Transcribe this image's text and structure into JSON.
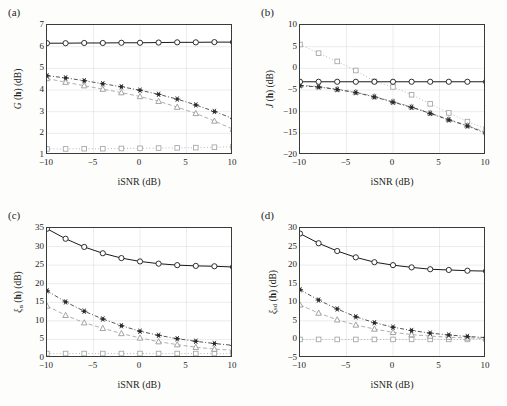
{
  "figure": {
    "background": "#fdfdfb",
    "axis_color": "#3a3a3a",
    "grid_color": "#d8d8d8"
  },
  "series_styles": [
    {
      "name": "circle-solid",
      "marker": "circle",
      "line": "solid",
      "color": "#1a1a1a",
      "fill": "none"
    },
    {
      "name": "star-dashdot",
      "marker": "star",
      "line": "dashdot",
      "color": "#2b2b2b",
      "fill": "#2b2b2b"
    },
    {
      "name": "triangle-dashed",
      "marker": "triangle",
      "line": "dashed",
      "color": "#9a9a9a",
      "fill": "none"
    },
    {
      "name": "square-dotted",
      "marker": "square",
      "line": "dotted",
      "color": "#a8a8a8",
      "fill": "none"
    }
  ],
  "panels": [
    {
      "label": "(a)",
      "name": "panel-a",
      "chart_data": {
        "type": "line",
        "title": "",
        "xlabel": "iSNR (dB)",
        "ylabel": "G(h) (dB)",
        "ylabel_main": "G",
        "ylabel_sub": "",
        "ylabel_tail": "(h) (dB)",
        "xlim": [
          -10,
          10
        ],
        "ylim": [
          1,
          7
        ],
        "xticks": [
          -10,
          -5,
          0,
          5,
          10
        ],
        "xticklabels": [
          "-10",
          "-5",
          "0",
          "5",
          "10"
        ],
        "yticks": [
          1,
          2,
          3,
          4,
          5,
          6,
          7
        ],
        "yticklabels": [
          "1",
          "2",
          "3",
          "4",
          "5",
          "6",
          "7"
        ],
        "grid": true,
        "legend": "none",
        "x": [
          -10,
          -8,
          -6,
          -4,
          -2,
          0,
          2,
          4,
          6,
          8,
          10
        ],
        "series": [
          {
            "name": "circle-solid",
            "values": [
              6.16,
              6.16,
              6.17,
              6.17,
              6.18,
              6.18,
              6.19,
              6.2,
              6.2,
              6.21,
              6.21
            ]
          },
          {
            "name": "star-dashdot",
            "values": [
              4.66,
              4.56,
              4.43,
              4.29,
              4.15,
              3.99,
              3.8,
              3.58,
              3.31,
              3.01,
              2.68
            ]
          },
          {
            "name": "triangle-dashed",
            "values": [
              4.53,
              4.36,
              4.2,
              4.04,
              3.88,
              3.7,
              3.48,
              3.21,
              2.92,
              2.57,
              2.19
            ]
          },
          {
            "name": "square-dotted",
            "values": [
              1.28,
              1.28,
              1.29,
              1.29,
              1.3,
              1.31,
              1.32,
              1.33,
              1.34,
              1.36,
              1.38
            ]
          }
        ]
      }
    },
    {
      "label": "(b)",
      "name": "panel-b",
      "chart_data": {
        "type": "line",
        "title": "",
        "xlabel": "iSNR (dB)",
        "ylabel": "J(h) (dB)",
        "ylabel_main": "J",
        "ylabel_sub": "",
        "ylabel_tail": "(h) (dB)",
        "xlim": [
          -10,
          10
        ],
        "ylim": [
          -20,
          10
        ],
        "xticks": [
          -10,
          -5,
          0,
          5,
          10
        ],
        "xticklabels": [
          "-10",
          "-5",
          "0",
          "5",
          "10"
        ],
        "yticks": [
          -20,
          -15,
          -10,
          -5,
          0,
          5,
          10
        ],
        "yticklabels": [
          "-20",
          "-15",
          "-10",
          "-5",
          "0",
          "5",
          "10"
        ],
        "grid": true,
        "legend": "none",
        "x": [
          -10,
          -8,
          -6,
          -4,
          -2,
          0,
          2,
          4,
          6,
          8,
          10
        ],
        "series": [
          {
            "name": "circle-solid",
            "values": [
              -3.1,
              -3.1,
              -3.1,
              -3.1,
              -3.1,
              -3.1,
              -3.1,
              -3.1,
              -3.1,
              -3.1,
              -3.1
            ]
          },
          {
            "name": "star-dashdot",
            "values": [
              -4.0,
              -4.3,
              -4.9,
              -5.6,
              -6.6,
              -7.8,
              -9.0,
              -10.4,
              -11.9,
              -13.3,
              -15.0
            ]
          },
          {
            "name": "triangle-dashed",
            "values": [
              -3.9,
              -4.2,
              -4.8,
              -5.5,
              -6.5,
              -7.7,
              -8.9,
              -10.3,
              -11.8,
              -13.2,
              -14.8
            ]
          },
          {
            "name": "square-dotted",
            "values": [
              5.5,
              3.5,
              1.6,
              -0.5,
              -3.0,
              -4.3,
              -6.1,
              -8.2,
              -10.3,
              -12.3,
              -14.0
            ]
          }
        ]
      }
    },
    {
      "label": "(c)",
      "name": "panel-c",
      "chart_data": {
        "type": "line",
        "title": "",
        "xlabel": "iSNR (dB)",
        "ylabel": "ξn(h) (dB)",
        "ylabel_main": "ξ",
        "ylabel_sub": "n",
        "ylabel_tail": "(h) (dB)",
        "xlim": [
          -10,
          10
        ],
        "ylim": [
          0,
          35
        ],
        "xticks": [
          -10,
          -5,
          0,
          5,
          10
        ],
        "xticklabels": [
          "-10",
          "-5",
          "0",
          "5",
          "10"
        ],
        "yticks": [
          0,
          5,
          10,
          15,
          20,
          25,
          30,
          35
        ],
        "yticklabels": [
          "0",
          "5",
          "10",
          "15",
          "20",
          "25",
          "30",
          "35"
        ],
        "grid": true,
        "legend": "none",
        "x": [
          -10,
          -8,
          -6,
          -4,
          -2,
          0,
          2,
          4,
          6,
          8,
          10
        ],
        "series": [
          {
            "name": "circle-solid",
            "values": [
              34.8,
              32.1,
              29.9,
              28.2,
              26.9,
              26.0,
              25.4,
              25.0,
              24.8,
              24.7,
              24.5
            ]
          },
          {
            "name": "star-dashdot",
            "values": [
              18.1,
              15.1,
              12.6,
              10.5,
              8.7,
              7.2,
              6.1,
              5.2,
              4.5,
              3.9,
              3.4
            ]
          },
          {
            "name": "triangle-dashed",
            "values": [
              14.0,
              11.5,
              9.5,
              8.0,
              6.6,
              5.4,
              4.4,
              3.6,
              2.9,
              2.4,
              2.1
            ]
          },
          {
            "name": "square-dotted",
            "values": [
              1.2,
              1.2,
              1.2,
              1.2,
              1.2,
              1.2,
              1.2,
              1.2,
              1.2,
              1.2,
              1.2
            ]
          }
        ]
      }
    },
    {
      "label": "(d)",
      "name": "panel-d",
      "chart_data": {
        "type": "line",
        "title": "",
        "xlabel": "iSNR (dB)",
        "ylabel": "ξsd(h) (dB)",
        "ylabel_main": "ξ",
        "ylabel_sub": "sd",
        "ylabel_tail": "(h) (dB)",
        "xlim": [
          -10,
          10
        ],
        "ylim": [
          -5,
          30
        ],
        "xticks": [
          -10,
          -5,
          0,
          5,
          10
        ],
        "xticklabels": [
          "-10",
          "-5",
          "0",
          "5",
          "10"
        ],
        "yticks": [
          -5,
          0,
          5,
          10,
          15,
          20,
          25,
          30
        ],
        "yticklabels": [
          "-5",
          "0",
          "5",
          "10",
          "15",
          "20",
          "25",
          "30"
        ],
        "grid": true,
        "legend": "none",
        "x": [
          -10,
          -8,
          -6,
          -4,
          -2,
          0,
          2,
          4,
          6,
          8,
          10
        ],
        "series": [
          {
            "name": "circle-solid",
            "values": [
              28.5,
              25.9,
              23.8,
              22.1,
              20.8,
              20.0,
              19.4,
              18.9,
              18.7,
              18.5,
              18.4
            ]
          },
          {
            "name": "star-dashdot",
            "values": [
              13.4,
              10.6,
              8.2,
              6.1,
              4.5,
              3.3,
              2.4,
              1.7,
              1.2,
              0.8,
              0.5
            ]
          },
          {
            "name": "triangle-dashed",
            "values": [
              9.3,
              7.1,
              5.3,
              3.9,
              2.8,
              1.9,
              1.3,
              0.9,
              0.6,
              0.4,
              0.3
            ]
          },
          {
            "name": "square-dotted",
            "values": [
              0.0,
              0.0,
              0.0,
              0.0,
              0.0,
              0.0,
              0.0,
              0.0,
              0.0,
              0.0,
              0.05
            ]
          }
        ]
      }
    }
  ]
}
